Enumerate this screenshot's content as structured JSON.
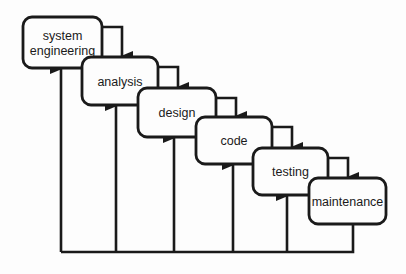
{
  "diagram": {
    "type": "waterfall-model",
    "stroke_color": "#1a1a1a",
    "background": "#fdfdfd",
    "phases": [
      {
        "id": "system-engineering",
        "lines": [
          "system",
          "engineering"
        ],
        "x": 23,
        "y": 17,
        "w": 79,
        "h": 51,
        "feedback_x": 61
      },
      {
        "id": "analysis",
        "lines": [
          "analysis"
        ],
        "x": 82,
        "y": 57,
        "w": 76,
        "h": 48,
        "feedback_x": 116
      },
      {
        "id": "design",
        "lines": [
          "design"
        ],
        "x": 138,
        "y": 88,
        "w": 78,
        "h": 49,
        "feedback_x": 174
      },
      {
        "id": "code",
        "lines": [
          "code"
        ],
        "x": 196,
        "y": 117,
        "w": 76,
        "h": 47,
        "feedback_x": 233
      },
      {
        "id": "testing",
        "lines": [
          "testing"
        ],
        "x": 253,
        "y": 148,
        "w": 75,
        "h": 47,
        "feedback_x": 287
      },
      {
        "id": "maintenance",
        "lines": [
          "maintenance"
        ],
        "x": 309,
        "y": 178,
        "w": 77,
        "h": 46,
        "feedback_x": 353
      }
    ],
    "feedback_bus_y": 252
  }
}
